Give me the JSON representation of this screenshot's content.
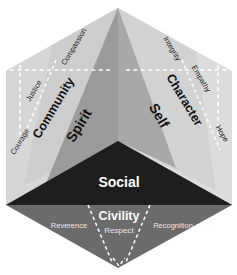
{
  "diagram": {
    "type": "isometric-cube-hexagon",
    "colors": {
      "face_left_panel": "#d7d7d7",
      "face_left_inner": "#c6c6c6",
      "face_left_center": "#9b9b9b",
      "face_right_panel": "#dcdcdc",
      "face_right_inner": "#cfcfcf",
      "face_right_center": "#a6a6a6",
      "face_bottom_top": "#1e1e1e",
      "face_bottom_lower": "#6b6b6b",
      "dash_color": "#ffffff",
      "text_dark": "#1a1a1a",
      "text_light": "#ffffff",
      "background": "#ffffff"
    },
    "faces": [
      {
        "id": "spirit",
        "center_label": "Spirit",
        "domain_label": "Community",
        "values": [
          "Courage",
          "Justice",
          "Compassion"
        ]
      },
      {
        "id": "self",
        "center_label": "Self",
        "domain_label": "Character",
        "values": [
          "Integrity",
          "Empathy",
          "Hope"
        ]
      },
      {
        "id": "social",
        "center_label": "Social",
        "domain_label": "Civility",
        "values": [
          "Reverence",
          "Respect",
          "Recognition"
        ]
      }
    ],
    "labels": {
      "spirit": "Spirit",
      "community": "Community",
      "courage": "Courage",
      "justice": "Justice",
      "compassion": "Compassion",
      "self": "Self",
      "character": "Character",
      "integrity": "Integrity",
      "empathy": "Empathy",
      "hope": "Hope",
      "social": "Social",
      "civility": "Civility",
      "reverence": "Reverence",
      "respect": "Respect",
      "recognition": "Recognition"
    }
  }
}
